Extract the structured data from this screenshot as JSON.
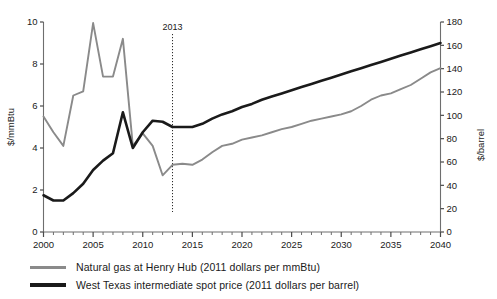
{
  "chart_data": {
    "type": "line",
    "title": "",
    "xlabel": "",
    "ylabel": "$/mmBtu",
    "y2label": "$/barrel",
    "xlim": [
      2000,
      2040
    ],
    "ylim": [
      0,
      10
    ],
    "y2lim": [
      0,
      180
    ],
    "grid": false,
    "legend_position": "bottom-left",
    "x_tick_labels": [
      "2000",
      "2005",
      "2010",
      "2015",
      "2020",
      "2025",
      "2030",
      "2035",
      "2040"
    ],
    "x_tick_values": [
      2000,
      2005,
      2010,
      2015,
      2020,
      2025,
      2030,
      2035,
      2040
    ],
    "x_minor_step": 1,
    "y_tick_labels": [
      "0",
      "2",
      "4",
      "6",
      "8",
      "10"
    ],
    "y_tick_values": [
      0,
      2,
      4,
      6,
      8,
      10
    ],
    "y2_tick_labels": [
      "0",
      "20",
      "40",
      "60",
      "80",
      "100",
      "120",
      "140",
      "160",
      "180"
    ],
    "y2_tick_values": [
      0,
      20,
      40,
      60,
      80,
      100,
      120,
      140,
      160,
      180
    ],
    "annotations": [
      {
        "text": "2013",
        "x": 2013,
        "type": "vertical-divider",
        "note": "history / projection boundary"
      }
    ],
    "x": [
      2000,
      2001,
      2002,
      2003,
      2004,
      2005,
      2006,
      2007,
      2008,
      2009,
      2010,
      2011,
      2012,
      2013,
      2014,
      2015,
      2016,
      2017,
      2018,
      2019,
      2020,
      2021,
      2022,
      2023,
      2024,
      2025,
      2026,
      2027,
      2028,
      2029,
      2030,
      2031,
      2032,
      2033,
      2034,
      2035,
      2036,
      2037,
      2038,
      2039,
      2040
    ],
    "series": [
      {
        "name": "Natural gas at Henry Hub (2011 dollars per mmBtu)",
        "axis": "left",
        "unit": "$/mmBtu",
        "color": "#8a8a8a",
        "width": 1.9,
        "values": [
          5.5,
          4.75,
          4.1,
          6.5,
          6.7,
          9.95,
          7.4,
          7.4,
          9.2,
          4.1,
          4.7,
          4.1,
          2.7,
          3.2,
          3.25,
          3.2,
          3.45,
          3.8,
          4.1,
          4.2,
          4.4,
          4.5,
          4.6,
          4.75,
          4.9,
          5.0,
          5.15,
          5.3,
          5.4,
          5.5,
          5.6,
          5.75,
          6.0,
          6.3,
          6.5,
          6.6,
          6.8,
          7.0,
          7.3,
          7.6,
          7.8
        ]
      },
      {
        "name": "West Texas intermediate spot price (2011 dollars per barrel)",
        "axis": "right",
        "unit": "$/barrel",
        "color": "#1a1a1a",
        "width": 2.6,
        "values_left_scale": [
          1.75,
          1.5,
          1.5,
          1.85,
          2.3,
          2.95,
          3.4,
          3.75,
          5.7,
          4.0,
          4.75,
          5.3,
          5.25,
          5.0,
          5.0,
          5.0,
          5.15,
          5.4,
          5.6,
          5.75,
          5.95,
          6.1,
          6.3,
          6.45,
          6.6,
          6.75,
          6.9,
          7.05,
          7.2,
          7.35,
          7.5,
          7.65,
          7.8,
          7.95,
          8.1,
          8.25,
          8.4,
          8.55,
          8.7,
          8.85,
          9.0
        ],
        "values": [
          31.5,
          27.0,
          27.0,
          33.3,
          41.4,
          53.1,
          61.2,
          67.5,
          102.6,
          72.0,
          85.5,
          95.4,
          94.5,
          90.0,
          90.0,
          90.0,
          92.7,
          97.2,
          100.8,
          103.5,
          107.1,
          109.8,
          113.4,
          116.1,
          118.8,
          121.5,
          124.2,
          126.9,
          129.6,
          132.3,
          135.0,
          137.7,
          140.4,
          143.1,
          145.8,
          148.5,
          151.2,
          153.9,
          156.6,
          159.3,
          162.0
        ]
      }
    ]
  },
  "legend": {
    "items": [
      {
        "label": "Natural gas at Henry Hub (2011 dollars per mmBtu)",
        "color": "#8a8a8a",
        "thickness": 3
      },
      {
        "label": "West Texas intermediate spot price (2011 dollars per barrel)",
        "color": "#1a1a1a",
        "thickness": 4
      }
    ]
  }
}
